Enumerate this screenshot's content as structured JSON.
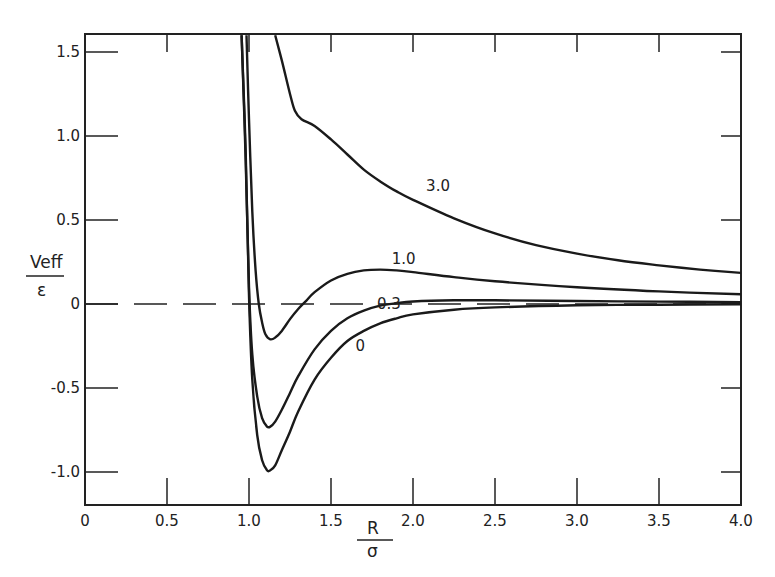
{
  "chart_data": {
    "type": "line",
    "title": "",
    "xlabel": "R / σ",
    "ylabel": "V_eff / ε",
    "xlabel_parts": {
      "numerator": "R",
      "denominator": "σ"
    },
    "ylabel_parts": {
      "numerator": "Veff",
      "denominator": "ε"
    },
    "xlim": [
      0,
      4.0
    ],
    "ylim": [
      -1.2,
      1.6
    ],
    "grid": false,
    "legend": "inline curve labels",
    "x_ticks": [
      0,
      0.5,
      1.0,
      1.5,
      2.0,
      2.5,
      3.0,
      3.5,
      4.0
    ],
    "x_tick_labels": [
      "0",
      "0.5",
      "1.0",
      "1.5",
      "2.0",
      "2.5",
      "3.0",
      "3.5",
      "4.0"
    ],
    "y_ticks": [
      -1.0,
      -0.5,
      0,
      0.5,
      1.0,
      1.5
    ],
    "y_tick_labels": [
      "-1.0",
      "-0.5",
      "0",
      "0.5",
      "1.0",
      "1.5"
    ],
    "reference_line": {
      "y": 0,
      "style": "dashed"
    },
    "series": [
      {
        "name": "0",
        "label_pos": [
          1.65,
          -0.25
        ],
        "points": [
          [
            0.955,
            1.6
          ],
          [
            0.98,
            0.9
          ],
          [
            1.0,
            0.05
          ],
          [
            1.02,
            -0.45
          ],
          [
            1.05,
            -0.78
          ],
          [
            1.08,
            -0.93
          ],
          [
            1.11,
            -0.99
          ],
          [
            1.13,
            -0.99
          ],
          [
            1.16,
            -0.96
          ],
          [
            1.2,
            -0.87
          ],
          [
            1.25,
            -0.76
          ],
          [
            1.3,
            -0.64
          ],
          [
            1.4,
            -0.45
          ],
          [
            1.5,
            -0.32
          ],
          [
            1.6,
            -0.22
          ],
          [
            1.7,
            -0.16
          ],
          [
            1.8,
            -0.115
          ],
          [
            1.9,
            -0.085
          ],
          [
            2.0,
            -0.062
          ],
          [
            2.25,
            -0.034
          ],
          [
            2.5,
            -0.02
          ],
          [
            3.0,
            -0.008
          ],
          [
            3.5,
            -0.004
          ],
          [
            4.0,
            -0.002
          ]
        ]
      },
      {
        "name": "0.3",
        "label_pos": [
          1.78,
          0.0
        ],
        "points": [
          [
            0.955,
            1.6
          ],
          [
            0.98,
            0.85
          ],
          [
            1.0,
            0.1
          ],
          [
            1.02,
            -0.3
          ],
          [
            1.05,
            -0.55
          ],
          [
            1.08,
            -0.68
          ],
          [
            1.11,
            -0.73
          ],
          [
            1.13,
            -0.73
          ],
          [
            1.16,
            -0.7
          ],
          [
            1.2,
            -0.63
          ],
          [
            1.25,
            -0.53
          ],
          [
            1.3,
            -0.43
          ],
          [
            1.4,
            -0.27
          ],
          [
            1.5,
            -0.16
          ],
          [
            1.6,
            -0.085
          ],
          [
            1.7,
            -0.04
          ],
          [
            1.8,
            -0.01
          ],
          [
            1.9,
            0.005
          ],
          [
            2.0,
            0.015
          ],
          [
            2.25,
            0.022
          ],
          [
            2.5,
            0.022
          ],
          [
            3.0,
            0.018
          ],
          [
            3.5,
            0.014
          ],
          [
            4.0,
            0.011
          ]
        ]
      },
      {
        "name": "1.0",
        "label_pos": [
          1.87,
          0.27
        ],
        "points": [
          [
            0.985,
            1.6
          ],
          [
            1.0,
            1.1
          ],
          [
            1.02,
            0.55
          ],
          [
            1.04,
            0.2
          ],
          [
            1.06,
            0.0
          ],
          [
            1.08,
            -0.11
          ],
          [
            1.1,
            -0.18
          ],
          [
            1.13,
            -0.21
          ],
          [
            1.16,
            -0.2
          ],
          [
            1.2,
            -0.16
          ],
          [
            1.25,
            -0.09
          ],
          [
            1.3,
            -0.03
          ],
          [
            1.35,
            0.02
          ],
          [
            1.4,
            0.07
          ],
          [
            1.5,
            0.14
          ],
          [
            1.6,
            0.18
          ],
          [
            1.7,
            0.2
          ],
          [
            1.8,
            0.205
          ],
          [
            1.9,
            0.2
          ],
          [
            2.0,
            0.19
          ],
          [
            2.25,
            0.16
          ],
          [
            2.5,
            0.135
          ],
          [
            3.0,
            0.1
          ],
          [
            3.5,
            0.075
          ],
          [
            4.0,
            0.058
          ]
        ]
      },
      {
        "name": "3.0",
        "label_pos": [
          2.08,
          0.7
        ],
        "points": [
          [
            1.16,
            1.6
          ],
          [
            1.2,
            1.45
          ],
          [
            1.25,
            1.25
          ],
          [
            1.28,
            1.15
          ],
          [
            1.32,
            1.1
          ],
          [
            1.4,
            1.06
          ],
          [
            1.5,
            0.98
          ],
          [
            1.6,
            0.89
          ],
          [
            1.7,
            0.8
          ],
          [
            1.8,
            0.73
          ],
          [
            1.9,
            0.67
          ],
          [
            2.0,
            0.62
          ],
          [
            2.25,
            0.51
          ],
          [
            2.5,
            0.42
          ],
          [
            2.75,
            0.35
          ],
          [
            3.0,
            0.3
          ],
          [
            3.25,
            0.26
          ],
          [
            3.5,
            0.23
          ],
          [
            3.75,
            0.205
          ],
          [
            4.0,
            0.185
          ]
        ]
      }
    ]
  }
}
